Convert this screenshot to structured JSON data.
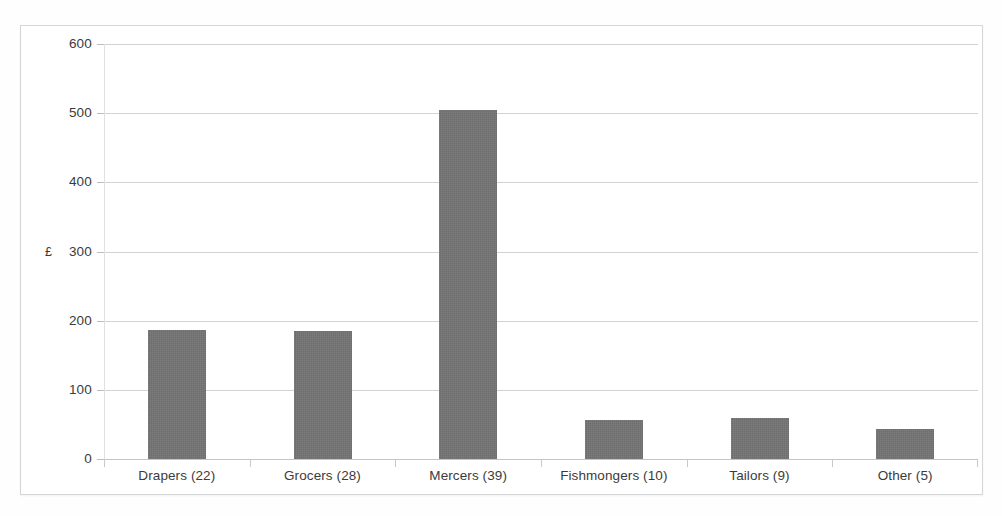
{
  "chart_data": {
    "type": "bar",
    "title": "",
    "subtitle": "",
    "xlabel": "",
    "ylabel": "£",
    "categories": [
      "Drapers (22)",
      "Grocers (28)",
      "Mercers (39)",
      "Fishmongers (10)",
      "Tailors (9)",
      "Other (5)"
    ],
    "values": [
      187,
      185,
      504,
      56,
      60,
      43
    ],
    "ylim": [
      0,
      600
    ],
    "y_ticks": [
      0,
      100,
      200,
      300,
      400,
      500,
      600
    ],
    "y_tick_labels": [
      "0",
      "100",
      "200",
      "300",
      "400",
      "500",
      "600"
    ],
    "grid": true,
    "grid_axis": "y",
    "legend": false,
    "legend_position": "none",
    "bar_color": "#6e6e6e",
    "gridline_color": "#d2d2d2",
    "axis_text_color": "#3b3b3b",
    "frame_color": "#d6d6d6",
    "background_color": "#ffffff",
    "annotations": []
  }
}
